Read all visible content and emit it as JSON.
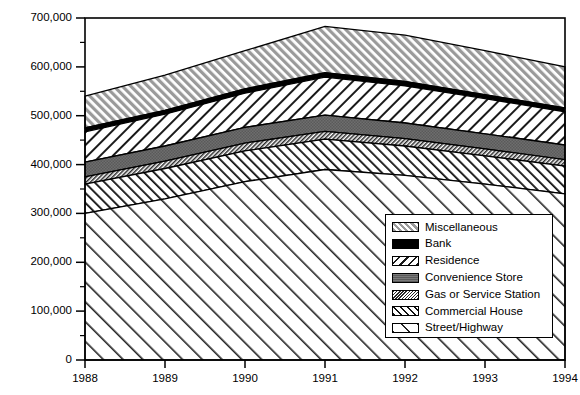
{
  "chart_data": {
    "type": "area",
    "title": "",
    "xlabel": "",
    "ylabel": "Total Robberies",
    "categories": [
      "1988",
      "1989",
      "1990",
      "1991",
      "1992",
      "1993",
      "1994"
    ],
    "x": [
      1988,
      1989,
      1990,
      1991,
      1992,
      1993,
      1994
    ],
    "ylim": [
      0,
      700000
    ],
    "yticks": [
      0,
      100000,
      200000,
      300000,
      400000,
      500000,
      600000,
      700000
    ],
    "ytick_labels": [
      "0",
      "100,000",
      "200,000",
      "300,000",
      "400,000",
      "500,000",
      "600,000",
      "700,000"
    ],
    "xlim": [
      1988,
      1994
    ],
    "grid": false,
    "stacked": true,
    "stack_order_bottom_to_top": [
      "Street/Highway",
      "Commercial House",
      "Gas or Service Station",
      "Convenience Store",
      "Residence",
      "Bank",
      "Miscellaneous"
    ],
    "legend_position": "inside-lower-right",
    "series": [
      {
        "name": "Street/Highway",
        "pattern": "diagonal-sparse-up",
        "values": [
          300000,
          330000,
          365000,
          390000,
          378000,
          360000,
          340000
        ]
      },
      {
        "name": "Commercial House",
        "pattern": "diagonal-dense-up",
        "values": [
          60000,
          62000,
          63000,
          62000,
          60000,
          58000,
          57000
        ]
      },
      {
        "name": "Gas or Service Station",
        "pattern": "hatch-fine-down",
        "values": [
          15000,
          15000,
          16000,
          16000,
          15000,
          14000,
          13000
        ]
      },
      {
        "name": "Convenience Store",
        "pattern": "solid-gray",
        "values": [
          30000,
          31000,
          32000,
          33000,
          32000,
          31000,
          30000
        ]
      },
      {
        "name": "Residence",
        "pattern": "diagonal-medium-down",
        "values": [
          62000,
          65000,
          70000,
          78000,
          76000,
          72000,
          68000
        ]
      },
      {
        "name": "Bank",
        "pattern": "solid-black",
        "values": [
          8000,
          8000,
          9000,
          9000,
          9000,
          8000,
          8000
        ]
      },
      {
        "name": "Miscellaneous",
        "pattern": "diagonal-gray-up",
        "values": [
          65000,
          72000,
          78000,
          95000,
          95000,
          90000,
          84000
        ]
      }
    ],
    "cumulative_tops": {
      "Street/Highway": [
        300000,
        330000,
        365000,
        390000,
        378000,
        360000,
        340000
      ],
      "Commercial House": [
        360000,
        392000,
        428000,
        452000,
        438000,
        418000,
        397000
      ],
      "Gas or Service Station": [
        375000,
        407000,
        444000,
        468000,
        453000,
        432000,
        410000
      ],
      "Convenience Store": [
        405000,
        438000,
        476000,
        501000,
        485000,
        463000,
        440000
      ],
      "Residence": [
        467000,
        503000,
        546000,
        579000,
        561000,
        535000,
        508000
      ],
      "Bank": [
        475000,
        511000,
        555000,
        588000,
        570000,
        543000,
        516000
      ],
      "Miscellaneous": [
        540000,
        583000,
        633000,
        683000,
        665000,
        633000,
        600000
      ]
    }
  },
  "legend": {
    "items": [
      {
        "label": "Miscellaneous",
        "pattern": "diagonal-gray-up"
      },
      {
        "label": "Bank",
        "pattern": "solid-black"
      },
      {
        "label": "Residence",
        "pattern": "diagonal-medium-down"
      },
      {
        "label": "Convenience Store",
        "pattern": "solid-gray"
      },
      {
        "label": "Gas or Service Station",
        "pattern": "hatch-fine-down"
      },
      {
        "label": "Commercial House",
        "pattern": "diagonal-dense-up"
      },
      {
        "label": "Street/Highway",
        "pattern": "diagonal-sparse-up"
      }
    ]
  },
  "colors": {
    "axis": "#000000",
    "background": "#ffffff",
    "gray_fill": "#808080",
    "light_gray_fill": "#b8b8b8",
    "black_fill": "#000000"
  }
}
